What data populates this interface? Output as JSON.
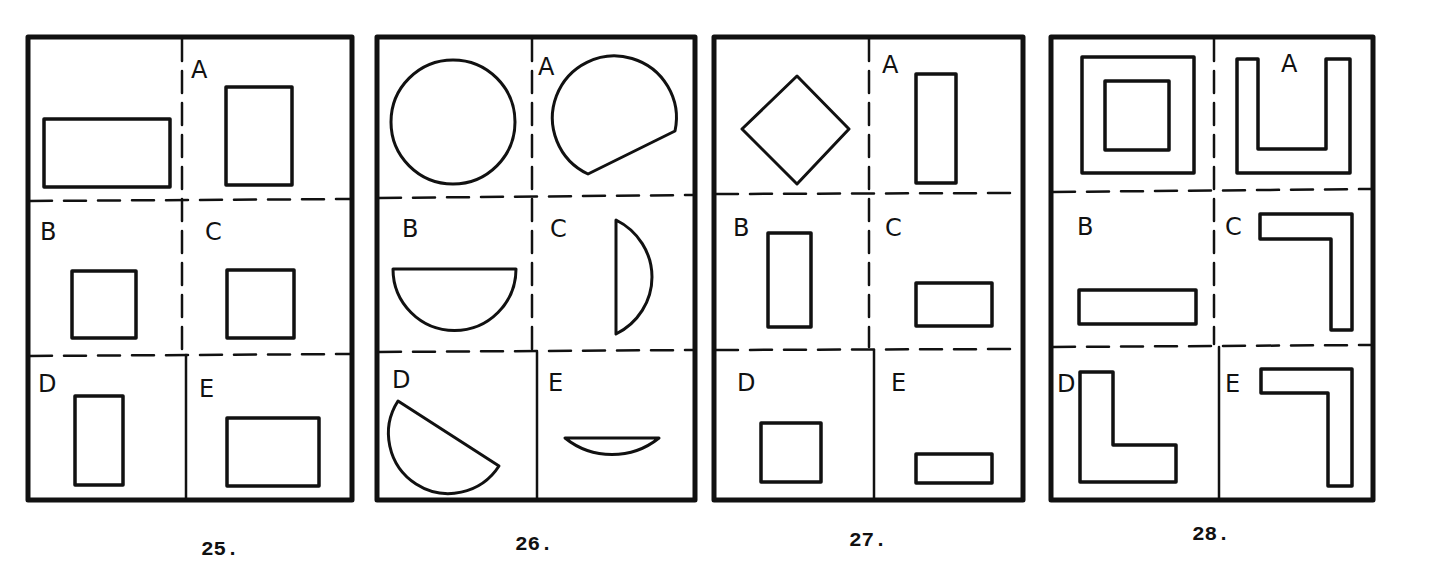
{
  "page": {
    "type": "spatial-reasoning test items",
    "ink_color": "#111111",
    "background": "#ffffff"
  },
  "puzzles": [
    {
      "number": "25.",
      "target_shape": "horizontal rectangle",
      "options": [
        {
          "label": "A",
          "shape": "tall rectangle"
        },
        {
          "label": "B",
          "shape": "square"
        },
        {
          "label": "C",
          "shape": "square"
        },
        {
          "label": "D",
          "shape": "narrow tall rectangle"
        },
        {
          "label": "E",
          "shape": "wide rectangle"
        }
      ]
    },
    {
      "number": "26.",
      "target_shape": "circle",
      "options": [
        {
          "label": "A",
          "shape": "circle with segment cut off"
        },
        {
          "label": "B",
          "shape": "half circle (flat top)"
        },
        {
          "label": "C",
          "shape": "circular segment (flat left)"
        },
        {
          "label": "D",
          "shape": "tilted half circle"
        },
        {
          "label": "E",
          "shape": "thin circular segment"
        }
      ]
    },
    {
      "number": "27.",
      "target_shape": "diamond (rotated square)",
      "options": [
        {
          "label": "A",
          "shape": "tall narrow rectangle"
        },
        {
          "label": "B",
          "shape": "tall rectangle"
        },
        {
          "label": "C",
          "shape": "wide rectangle"
        },
        {
          "label": "D",
          "shape": "square"
        },
        {
          "label": "E",
          "shape": "thin wide rectangle"
        }
      ]
    },
    {
      "number": "28.",
      "target_shape": "square frame",
      "options": [
        {
          "label": "A",
          "shape": "U shape"
        },
        {
          "label": "B",
          "shape": "long bar"
        },
        {
          "label": "C",
          "shape": "L shape (top-right corner)"
        },
        {
          "label": "D",
          "shape": "L shape (bottom-left corner)"
        },
        {
          "label": "E",
          "shape": "L shape (top-right corner)"
        }
      ]
    }
  ]
}
